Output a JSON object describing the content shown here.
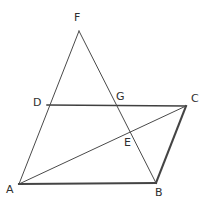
{
  "figure": {
    "canvas": {
      "width": 209,
      "height": 211,
      "background": "#ffffff"
    },
    "stroke_colors": {
      "thick": "#444444",
      "medium": "#404040",
      "thin": "#4a4a4a"
    },
    "vertices": [
      {
        "id": "F",
        "label": "F",
        "x": 79,
        "y": 31,
        "label_x": 74,
        "label_y": 12
      },
      {
        "id": "D",
        "label": "D",
        "x": 47,
        "y": 105,
        "label_x": 33,
        "label_y": 97
      },
      {
        "id": "G",
        "label": "G",
        "x": 118,
        "y": 105,
        "label_x": 116,
        "label_y": 91
      },
      {
        "id": "C",
        "label": "C",
        "x": 186,
        "y": 106,
        "label_x": 191,
        "label_y": 93
      },
      {
        "id": "E",
        "label": "E",
        "x": 129,
        "y": 133,
        "label_x": 124,
        "label_y": 137
      },
      {
        "id": "A",
        "label": "A",
        "x": 19,
        "y": 184,
        "label_x": 6,
        "label_y": 184
      },
      {
        "id": "B",
        "label": "B",
        "x": 156,
        "y": 183,
        "label_x": 155,
        "label_y": 187
      }
    ],
    "segments": [
      {
        "id": "AB",
        "name": "segment-ab",
        "from": "A",
        "to": "B",
        "weight": "thick"
      },
      {
        "id": "DC",
        "name": "segment-dc",
        "from": "D",
        "to": "C",
        "weight": "med"
      },
      {
        "id": "CB",
        "name": "segment-cb",
        "from": "C",
        "to": "B",
        "weight": "thick"
      },
      {
        "id": "AF",
        "name": "segment-af-through-d",
        "from": "A",
        "to": "F",
        "weight": "thin"
      },
      {
        "id": "FB",
        "name": "segment-fb-through-g-e",
        "from": "F",
        "to": "B",
        "weight": "thin"
      },
      {
        "id": "AC",
        "name": "diagonal-ac-through-e",
        "from": "A",
        "to": "C",
        "weight": "thin"
      }
    ]
  }
}
